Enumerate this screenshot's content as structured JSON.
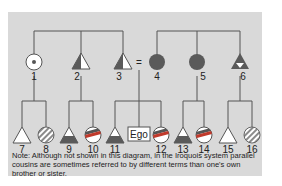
{
  "diagram": {
    "colors": {
      "panel_bg": "#d9d9d9",
      "line": "#555555",
      "dark_fill": "#5a5a5a",
      "red_band": "#c0392b",
      "white": "#ffffff"
    },
    "generation_1": [
      {
        "id": "1",
        "shape": "circle",
        "pattern": "dot-center"
      },
      {
        "id": "2",
        "shape": "triangle",
        "pattern": "half-dark-left"
      },
      {
        "id": "3",
        "shape": "triangle",
        "pattern": "half-dark-left"
      },
      {
        "id": "4",
        "shape": "circle",
        "pattern": "solid-dark"
      },
      {
        "id": "5",
        "shape": "circle",
        "pattern": "solid-dark"
      },
      {
        "id": "6",
        "shape": "triangle",
        "pattern": "dark-with-white-inverted-triangle"
      }
    ],
    "marriage_symbol": "=",
    "generation_2": [
      {
        "id": "7",
        "shape": "triangle",
        "pattern": "white"
      },
      {
        "id": "8",
        "shape": "circle",
        "pattern": "diagonal-stripes"
      },
      {
        "id": "9",
        "shape": "triangle",
        "pattern": "dark-bottom"
      },
      {
        "id": "10",
        "shape": "circle",
        "pattern": "red-band"
      },
      {
        "id": "11",
        "shape": "triangle",
        "pattern": "dark-bottom"
      },
      {
        "id": "ego",
        "label": "Ego",
        "shape": "box"
      },
      {
        "id": "12",
        "shape": "circle",
        "pattern": "red-band"
      },
      {
        "id": "13",
        "shape": "triangle",
        "pattern": "dark-bottom"
      },
      {
        "id": "14",
        "shape": "circle",
        "pattern": "red-band"
      },
      {
        "id": "15",
        "shape": "triangle",
        "pattern": "white"
      },
      {
        "id": "16",
        "shape": "circle",
        "pattern": "diagonal-stripes"
      }
    ],
    "labels": {
      "n1": "1",
      "n2": "2",
      "n3": "3",
      "n4": "4",
      "n5": "5",
      "n6": "6",
      "n7": "7",
      "n8": "8",
      "n9": "9",
      "n10": "10",
      "n11": "11",
      "n12": "12",
      "n13": "13",
      "n14": "14",
      "n15": "15",
      "n16": "16",
      "ego": "Ego",
      "equals": "="
    },
    "note": "Note: Although not shown in this diagram, in the Iroquois system parallel cousins are sometimes referred to by different terms than one's own brother or sister."
  }
}
